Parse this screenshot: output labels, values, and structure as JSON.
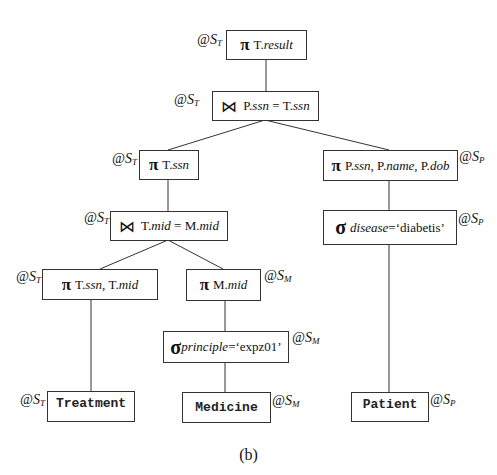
{
  "diagram": {
    "caption": "(b)",
    "sites": {
      "ST": {
        "prefix": "@S",
        "sub": "T"
      },
      "SP": {
        "prefix": "@S",
        "sub": "P"
      },
      "SM": {
        "prefix": "@S",
        "sub": "M"
      }
    },
    "nodes": {
      "root_project": {
        "op": "π",
        "pre": "T.",
        "attr": "result",
        "site": "ST"
      },
      "join_top": {
        "op": "⋈",
        "a1": "P.",
        "a1i": "ssn",
        "eq": " = ",
        "a2": "T.",
        "a2i": "ssn",
        "site": "ST"
      },
      "project_tssn": {
        "op": "π",
        "pre": "T.",
        "attr": "ssn",
        "site": "ST"
      },
      "join_mid": {
        "op": "⋈",
        "a1": "T.",
        "a1i": "mid",
        "eq": " = ",
        "a2": "M.",
        "a2i": "mid",
        "site": "ST"
      },
      "project_patient": {
        "op": "π",
        "p1": "P.",
        "p1i": "ssn",
        "sep1": ", ",
        "p2": "P.",
        "p2i": "name",
        "sep2": ", ",
        "p3": "P.",
        "p3i": "dob",
        "site": "SP"
      },
      "select_disease": {
        "op": "σ",
        "cond": "disease",
        "eq": "=",
        "value": "‘diabetis’",
        "site": "SP"
      },
      "project_treatment": {
        "op": "π",
        "p1": "T.",
        "p1i": "ssn",
        "sep": ", ",
        "p2": "T.",
        "p2i": "mid",
        "site": "ST"
      },
      "project_medicine": {
        "op": "π",
        "pre": "M.",
        "attr": "mid",
        "site": "SM"
      },
      "select_principle": {
        "op": "σ",
        "cond": "principle",
        "eq": "=",
        "value": "‘expz01’",
        "site": "SM"
      },
      "table_treatment": {
        "label": "Treatment",
        "site": "ST"
      },
      "table_medicine": {
        "label": "Medicine",
        "site": "SM"
      },
      "table_patient": {
        "label": "Patient",
        "site": "SP"
      }
    }
  }
}
